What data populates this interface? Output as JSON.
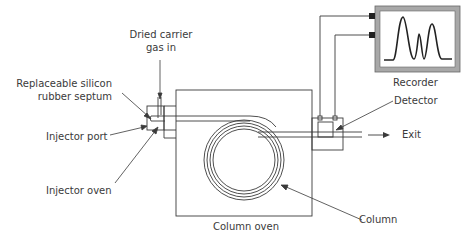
{
  "diagram": {
    "type": "gas-chromatograph-schematic",
    "labels": {
      "carrier_gas": [
        "Dried carrier",
        "gas in"
      ],
      "septum": [
        "Replaceable silicon",
        "rubber septum"
      ],
      "injector_port": "Injector port",
      "injector_oven": "Injector oven",
      "column_oven": "Column oven",
      "column": "Column",
      "detector": "Detector",
      "exit": "Exit",
      "recorder": "Recorder"
    },
    "components": [
      "carrier gas inlet",
      "septum",
      "injector port",
      "injector oven",
      "column oven",
      "coiled column",
      "detector",
      "exit",
      "recorder"
    ],
    "recorder_trace": {
      "peaks": 3,
      "relative_heights": [
        1.0,
        0.57,
        0.8
      ]
    },
    "colors": {
      "line": "#3a3a3a",
      "recorder_frame": "#a8a8a8",
      "connector": "#222222"
    }
  }
}
